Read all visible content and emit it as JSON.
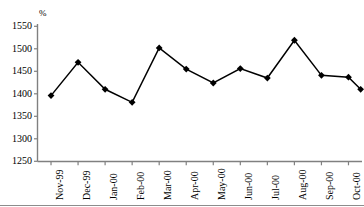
{
  "chart_data": {
    "type": "line",
    "title": "",
    "xlabel": "",
    "ylabel": "%",
    "ylim": [
      1250,
      1550
    ],
    "ytick_step": 50,
    "yticks": [
      1550,
      1500,
      1450,
      1400,
      1350,
      1300,
      1250
    ],
    "grid": false,
    "legend": "none",
    "marker": "diamond",
    "categories": [
      "Nov-99",
      "Dec-99",
      "Jan-00",
      "Feb-00",
      "Mar-00",
      "Apr-00",
      "May-00",
      "Jun-00",
      "Jul-00",
      "Aug-00",
      "Sep-00",
      "Oct-00"
    ],
    "values": [
      1396,
      1470,
      1410,
      1381,
      1502,
      1455,
      1424,
      1456,
      1435,
      1519,
      1441,
      1437
    ],
    "trailing_segment_value": 1410
  },
  "axis": {
    "y_unit_label": "%",
    "tick_labels_y": [
      "1550",
      "1500",
      "1450",
      "1400",
      "1350",
      "1300",
      "1250"
    ],
    "tick_labels_x": [
      "Nov-99",
      "Dec-99",
      "Jan-00",
      "Feb-00",
      "Mar-00",
      "Apr-00",
      "May-00",
      "Jun-00",
      "Jul-00",
      "Aug-00",
      "Sep-00",
      "Oct-00"
    ]
  },
  "header": {
    "title": ""
  },
  "colors": {
    "line": "#000000",
    "marker": "#000000",
    "axis": "#808080",
    "background": "#ffffff",
    "rule": "#8c8c8c"
  }
}
